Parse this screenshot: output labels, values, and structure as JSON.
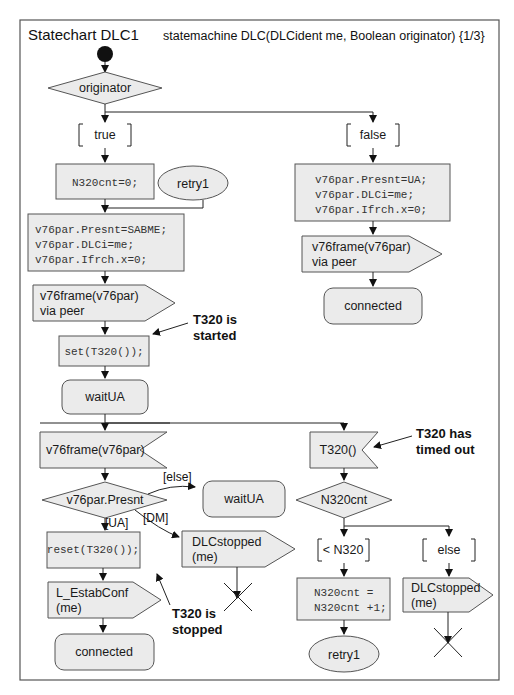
{
  "header": {
    "title": "Statechart DLC1",
    "signature": "statemachine DLC(DLCident me, Boolean originator)  {1/3}"
  },
  "decisions": {
    "originator": "originator",
    "presnt": "v76par.Presnt",
    "n320cnt": "N320cnt"
  },
  "guards": {
    "true": "true",
    "false": "false",
    "else_bracket": "[else]",
    "dm": "[DM]",
    "ua": "[UA]",
    "lt_n320": "< N320",
    "else": "else"
  },
  "tasks": {
    "init_cnt": "N320cnt=0;",
    "sabme": [
      "v76par.Presnt=SABME;",
      "v76par.DLCi=me;",
      "v76par.Ifrch.x=0;"
    ],
    "ua": [
      "v76par.Presnt=UA;",
      "v76par.DLCi=me;",
      "v76par.Ifrch.x=0;"
    ],
    "set_timer": "set(T320());",
    "reset_timer": "reset(T320());",
    "incr": [
      "N320cnt =",
      "N320cnt +1;"
    ]
  },
  "signals_out": {
    "frame_left": [
      "v76frame(v76par)",
      "via peer"
    ],
    "frame_right": [
      "v76frame(v76par)",
      "via peer"
    ],
    "stopped_mid": [
      "DLCstopped",
      "(me)"
    ],
    "estab": [
      "L_EstabConf",
      "(me)"
    ],
    "stopped_right": [
      "DLCstopped",
      "(me)"
    ]
  },
  "signals_in": {
    "frame": "v76frame(v76par)",
    "timer": "T320()"
  },
  "states": {
    "waitUA_main": "waitUA",
    "waitUA_else": "waitUA",
    "connected_right": "connected",
    "connected_left": "connected"
  },
  "connectors": {
    "retry1_top": "retry1",
    "retry1_bottom": "retry1"
  },
  "annotations": {
    "started": [
      "T320 is",
      "started"
    ],
    "timed_out": [
      "T320 has",
      "timed out"
    ],
    "stopped": [
      "T320 is",
      "stopped"
    ]
  }
}
